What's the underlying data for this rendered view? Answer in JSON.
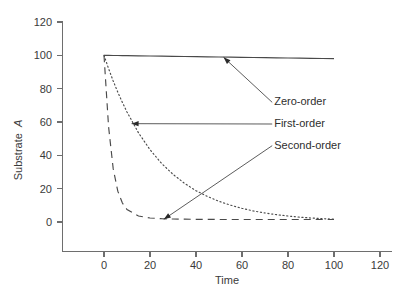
{
  "chart_data": {
    "type": "line",
    "title": "",
    "xlabel": "Time",
    "ylabel": "Substrate A",
    "ylabel_plain": "Substrate",
    "ylabel_italic": "A",
    "xlim": [
      -13,
      126
    ],
    "ylim": [
      -13,
      126
    ],
    "xticks": [
      0,
      20,
      40,
      60,
      80,
      100,
      120
    ],
    "yticks": [
      0,
      20,
      40,
      60,
      80,
      100,
      120
    ],
    "xtick_labels": [
      "0",
      "20",
      "40",
      "60",
      "80",
      "100",
      "120"
    ],
    "ytick_labels": [
      "0",
      "20",
      "40",
      "60",
      "80",
      "100",
      "120"
    ],
    "grid": false,
    "legend_position": "inline-annotations",
    "x": [
      0,
      2,
      4,
      6,
      8,
      10,
      15,
      20,
      25,
      30,
      35,
      40,
      45,
      50,
      55,
      60,
      65,
      70,
      75,
      80,
      85,
      90,
      95,
      100
    ],
    "series": [
      {
        "name": "Zero-order",
        "style": "solid",
        "values": [
          100.0,
          99.96,
          99.92,
          99.88,
          99.84,
          99.8,
          99.7,
          99.6,
          99.5,
          99.4,
          99.3,
          99.2,
          99.1,
          99.0,
          98.9,
          98.8,
          98.7,
          98.6,
          98.5,
          98.4,
          98.3,
          98.2,
          98.1,
          98.0
        ]
      },
      {
        "name": "First-order",
        "style": "dotted",
        "values": [
          100.0,
          92.0,
          84.6,
          77.9,
          71.7,
          66.0,
          53.5,
          43.4,
          35.2,
          28.6,
          23.2,
          18.8,
          15.3,
          12.4,
          10.1,
          8.2,
          6.6,
          5.4,
          4.4,
          3.6,
          2.9,
          2.4,
          2.0,
          1.7
        ]
      },
      {
        "name": "Second-order",
        "style": "dashed",
        "values": [
          100.0,
          57.0,
          32.0,
          18.5,
          11.4,
          7.5,
          3.6,
          2.4,
          2.0,
          1.8,
          1.7,
          1.6,
          1.6,
          1.5,
          1.5,
          1.5,
          1.5,
          1.5,
          1.5,
          1.5,
          1.5,
          1.5,
          1.5,
          1.5
        ]
      }
    ],
    "annotations": [
      {
        "label": "Zero-order",
        "target_x": 52,
        "target_y": 98.8,
        "text_x": 74,
        "text_y": 70
      },
      {
        "label": "First-order",
        "target_x": 12,
        "target_y": 59,
        "text_x": 74,
        "text_y": 57
      },
      {
        "label": "Second-order",
        "target_x": 26,
        "target_y": 1.6,
        "text_x": 74,
        "text_y": 44
      }
    ],
    "colors": {
      "line": "#4a4a4a",
      "axis": "#6e6e6e",
      "text": "#3a3a3a",
      "background": "#ffffff"
    }
  }
}
